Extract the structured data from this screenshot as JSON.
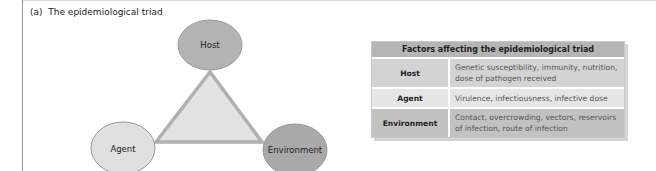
{
  "panel": {
    "label": "(a)",
    "title": "The epidemiological triad",
    "full_title": "(a)  The epidemiological triad"
  },
  "diagram": {
    "nodes": [
      {
        "id": "host",
        "label": "Host",
        "color": "#b3b3b3"
      },
      {
        "id": "agent",
        "label": "Agent",
        "color": "#e0e0e0"
      },
      {
        "id": "environment",
        "label": "Environment",
        "color": "#a9a9a9"
      }
    ],
    "triangle": {
      "fill": "#e2e2e2",
      "stroke": "#b0b0b0"
    }
  },
  "table": {
    "header": "Factors affecting the epidemiological triad",
    "rows": [
      {
        "factor": "Host",
        "description": "Genetic susceptibility, immunity, nutrition, dose of pathogen received"
      },
      {
        "factor": "Agent",
        "description": "Virulence, infectiousness, infective dose"
      },
      {
        "factor": "Environment",
        "description": "Contact, overcrowding, vectors, reservoirs of infection, route of infection"
      }
    ]
  }
}
